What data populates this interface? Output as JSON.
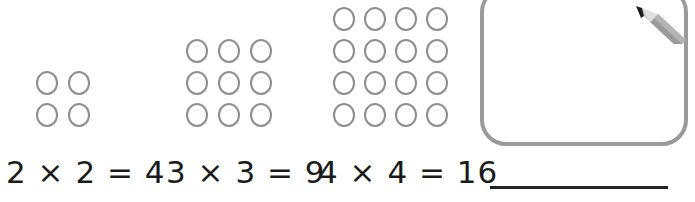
{
  "page": {
    "background_color": "#ffffff"
  },
  "arrays": [
    {
      "name": "2x2-array",
      "rows": 2,
      "columns": 2,
      "total": 4,
      "dot_shape": "circle-outline",
      "dot_color": "#8d8d8d"
    },
    {
      "name": "3x3-array",
      "rows": 3,
      "columns": 3,
      "total": 9,
      "dot_shape": "circle-outline",
      "dot_color": "#8d8d8d"
    },
    {
      "name": "4x4-array",
      "rows": 4,
      "columns": 4,
      "total": 16,
      "dot_shape": "circle-outline",
      "dot_color": "#8d8d8d"
    }
  ],
  "answer_box": {
    "name": "blank-answer-box",
    "content": "",
    "border_color": "#9a9a9a",
    "filled": false
  },
  "pencil": {
    "icon": "pencil-icon",
    "barrel_color": "#9b9b9b",
    "wood_color": "#e2e2e2",
    "tip_color": "#1d1d1d"
  },
  "equations": [
    {
      "text": "2 × 2 = 4"
    },
    {
      "text": "3 × 3 = 9"
    },
    {
      "text": "4 × 4 = 16"
    }
  ],
  "answer_blank": {
    "name": "answer-blank-line",
    "value": "",
    "line_color": "#222222"
  }
}
